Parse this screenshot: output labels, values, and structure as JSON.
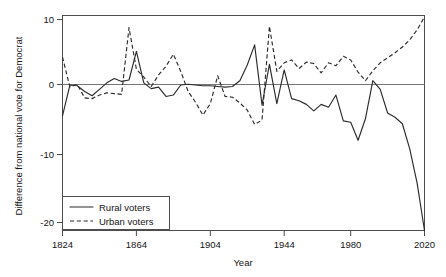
{
  "chart_data": {
    "type": "line",
    "title": "",
    "xlabel": "Year",
    "ylabel": "Difference from national vote for Democrat",
    "xlim": [
      1824,
      2020
    ],
    "ylim": [
      -20,
      10
    ],
    "xticks": [
      1824,
      1864,
      1904,
      1944,
      1980,
      2020
    ],
    "xticklabels": [
      "1824",
      "1864",
      "1904",
      "1944",
      "1980",
      "2020"
    ],
    "yticks": [
      10,
      0,
      -10,
      -20
    ],
    "yticklabels": [
      "10",
      "0",
      "-10",
      "-20"
    ],
    "grid": false,
    "zero_reference_line": 0,
    "legend_position": "lower left",
    "series": [
      {
        "name": "Rural voters",
        "style": "solid",
        "color": "#2b2b2b",
        "x": [
          1824,
          1828,
          1832,
          1836,
          1840,
          1844,
          1848,
          1852,
          1856,
          1860,
          1864,
          1868,
          1872,
          1876,
          1880,
          1884,
          1888,
          1892,
          1896,
          1900,
          1904,
          1908,
          1912,
          1916,
          1920,
          1924,
          1928,
          1932,
          1936,
          1940,
          1944,
          1948,
          1952,
          1956,
          1960,
          1964,
          1968,
          1972,
          1976,
          1980,
          1984,
          1988,
          1992,
          1996,
          2000,
          2004,
          2008,
          2012,
          2016,
          2020
        ],
        "values": [
          -4.0,
          0.3,
          0.2,
          -0.6,
          -1.2,
          -0.3,
          0.6,
          1.2,
          0.8,
          1.0,
          5.0,
          0.6,
          -0.2,
          0.0,
          -1.3,
          -1.1,
          0.3,
          0.4,
          0.3,
          0.2,
          0.2,
          0.1,
          0.0,
          0.1,
          0.9,
          3.1,
          5.9,
          -2.5,
          3.2,
          -2.3,
          2.4,
          -1.6,
          -1.9,
          -2.4,
          -3.3,
          -2.4,
          -2.8,
          -1.1,
          -4.7,
          -4.9,
          -7.4,
          -4.4,
          0.9,
          -0.3,
          -3.6,
          -4.2,
          -5.1,
          -8.6,
          -13.4,
          -20.0
        ]
      },
      {
        "name": "Urban voters",
        "style": "dashed",
        "color": "#2b2b2b",
        "x": [
          1824,
          1828,
          1832,
          1836,
          1840,
          1844,
          1848,
          1852,
          1856,
          1860,
          1864,
          1868,
          1872,
          1876,
          1880,
          1884,
          1888,
          1892,
          1896,
          1900,
          1904,
          1908,
          1912,
          1916,
          1920,
          1924,
          1928,
          1932,
          1936,
          1940,
          1944,
          1948,
          1952,
          1956,
          1960,
          1964,
          1968,
          1972,
          1976,
          1980,
          1984,
          1988,
          1992,
          1996,
          2000,
          2004,
          2008,
          2012,
          2016,
          2020
        ],
        "values": [
          4.2,
          0.0,
          0.4,
          -1.5,
          -1.6,
          -1.1,
          -0.8,
          -0.9,
          -1.0,
          8.3,
          2.5,
          1.4,
          0.1,
          1.7,
          2.9,
          4.6,
          2.2,
          -0.6,
          -2.1,
          -3.9,
          -2.3,
          1.6,
          -1.3,
          -1.4,
          -2.2,
          -3.2,
          -5.2,
          -4.6,
          8.5,
          2.2,
          3.4,
          3.8,
          2.6,
          3.5,
          3.3,
          2.0,
          3.4,
          3.0,
          4.3,
          3.8,
          2.1,
          0.9,
          2.3,
          3.4,
          4.1,
          4.8,
          5.6,
          6.6,
          8.0,
          9.8
        ]
      }
    ]
  },
  "legend": {
    "entries": [
      {
        "label": "Rural voters",
        "style": "solid"
      },
      {
        "label": "Urban voters",
        "style": "dashed"
      }
    ]
  }
}
